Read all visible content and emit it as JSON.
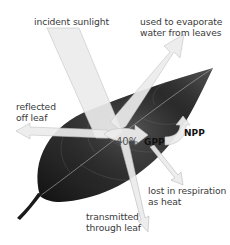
{
  "diagram": {
    "type": "energy-flow-through-leaf",
    "labels": {
      "incident": "incident sunlight",
      "evaporate_line1": "used to evaporate",
      "evaporate_line2": "water from leaves",
      "reflected_line1": "reflected",
      "reflected_line2": "off leaf",
      "percent": "40%",
      "gpp": "GPP",
      "npp": "NPP",
      "respiration_line1": "lost in respiration",
      "respiration_line2": "as heat",
      "transmitted_line1": "transmitted",
      "transmitted_line2": "through leaf"
    },
    "colors": {
      "leaf_dark": "#1e1e1e",
      "leaf_mid": "#4a4a4a",
      "arrow_fill": "#e9e9e9",
      "arrow_stroke": "#bdbdbd",
      "text": "#3a3a3a",
      "bold_text": "#111111"
    }
  }
}
